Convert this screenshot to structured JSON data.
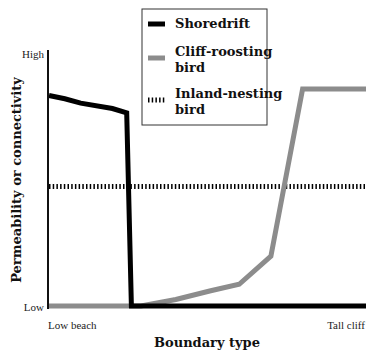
{
  "chart_data": {
    "type": "line",
    "title": "",
    "xlabel": "Boundary type",
    "ylabel": "Permeability or connectivity",
    "x_tick_labels": [
      "Low beach",
      "Tall cliff"
    ],
    "y_tick_labels": [
      "Low",
      "High"
    ],
    "x_range": [
      0,
      1
    ],
    "y_range": [
      0,
      1
    ],
    "grid": false,
    "legend_position": "top-right (boxed)",
    "series": [
      {
        "name": "Shoredrift",
        "color": "#000000",
        "style": "solid-thick",
        "x": [
          0.0,
          0.05,
          0.1,
          0.2,
          0.245,
          0.26,
          1.0
        ],
        "y": [
          0.97,
          0.955,
          0.935,
          0.91,
          0.89,
          0.0,
          0.0
        ]
      },
      {
        "name": "Cliff-roosting bird",
        "color": "#8c8c8c",
        "style": "solid-thick",
        "x": [
          0.0,
          0.29,
          0.4,
          0.51,
          0.6,
          0.7,
          0.8,
          1.0
        ],
        "y": [
          0.0,
          0.0,
          0.03,
          0.07,
          0.1,
          0.23,
          1.0,
          1.0
        ]
      },
      {
        "name": "Inland-nesting bird",
        "color": "#000000",
        "style": "dotted",
        "x": [
          0.0,
          1.0
        ],
        "y": [
          0.55,
          0.55
        ]
      }
    ]
  },
  "legend": {
    "items": [
      {
        "label_line1": "Shoredrift",
        "label_line2": ""
      },
      {
        "label_line1": "Cliff-roosting",
        "label_line2": "bird"
      },
      {
        "label_line1": "Inland-nesting",
        "label_line2": "bird"
      }
    ]
  },
  "axes": {
    "y_high": "High",
    "y_low": "Low",
    "x_left": "Low beach",
    "x_right": "Tall cliff",
    "x_title": "Boundary type",
    "y_title": "Permeability or connectivity"
  }
}
